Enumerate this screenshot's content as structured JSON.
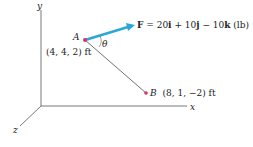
{
  "axes": {
    "x_label": "x",
    "y_label": "y",
    "z_label": "z"
  },
  "points": {
    "A": {
      "name": "A",
      "coords": "(4, 4, 2) ft"
    },
    "B": {
      "name": "B",
      "coords": "(8, 1, −2) ft"
    }
  },
  "force": {
    "symbol": "F",
    "expression": " = 20i + 10j − 10k (lb)",
    "equals": " = 20",
    "i": "i",
    "plus1": " + 10",
    "j": "j",
    "minus": " − 10",
    "k": "k",
    "unit": " (lb)"
  },
  "angle": {
    "symbol": "θ"
  },
  "colors": {
    "force_arrow": "#2aa7d8",
    "point": "#d6336c",
    "axis": "#555555",
    "line_AB": "#333333"
  }
}
